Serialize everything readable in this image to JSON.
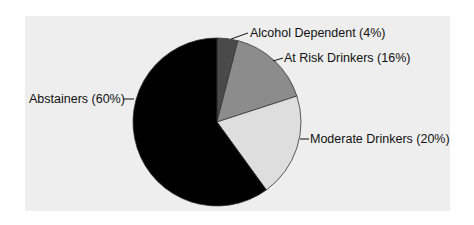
{
  "chart_data": {
    "type": "pie",
    "title": "",
    "start_angle": "12 o'clock, clockwise",
    "categories": [
      "Alcohol Dependent",
      "At Risk Drinkers",
      "Moderate Drinkers",
      "Abstainers"
    ],
    "values": [
      4,
      16,
      20,
      60
    ],
    "unit": "%",
    "labels": [
      "Alcohol Dependent (4%)",
      "At Risk Drinkers (16%)",
      "Moderate Drinkers (20%)",
      "Abstainers (60%)"
    ],
    "colors": [
      "#4a4a4a",
      "#8c8c8c",
      "#dedede",
      "#000000"
    ],
    "legend": "none (leader-line labels)",
    "background": "#eeeeee"
  }
}
